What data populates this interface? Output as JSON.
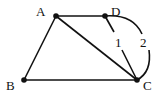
{
  "diagram": {
    "type": "geometry-figure",
    "points": {
      "A": {
        "label": "A",
        "x": 56,
        "y": 16
      },
      "D": {
        "label": "D",
        "x": 105,
        "y": 16
      },
      "B": {
        "label": "B",
        "x": 24,
        "y": 80
      },
      "C": {
        "label": "C",
        "x": 137,
        "y": 80
      }
    },
    "segments": [
      {
        "from": "A",
        "to": "D"
      },
      {
        "from": "A",
        "to": "B"
      },
      {
        "from": "A",
        "to": "C"
      },
      {
        "from": "B",
        "to": "C"
      }
    ],
    "paths": [
      {
        "id": "1",
        "label": "1",
        "kind": "straight",
        "from": "D",
        "to": "C"
      },
      {
        "id": "2",
        "label": "2",
        "kind": "arc",
        "from": "D",
        "to": "C"
      }
    ],
    "colors": {
      "stroke": "#111111",
      "background": "#ffffff"
    }
  }
}
